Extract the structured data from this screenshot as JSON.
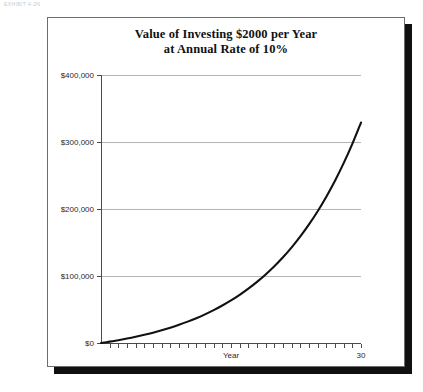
{
  "page_header": "EXHIBIT 4-2N",
  "chart_data": {
    "type": "line",
    "title_lines": [
      "Value of Investing $2000 per Year",
      "at Annual Rate of 10%"
    ],
    "title": "Value of Investing $2000 per Year at Annual Rate of 10%",
    "xlabel": "Year",
    "ylabel": "",
    "xlim": [
      0,
      30
    ],
    "ylim": [
      0,
      400000
    ],
    "grid": true,
    "legend": false,
    "x_tick_labels": [
      "30"
    ],
    "x_tick_label_values": [
      30
    ],
    "x_minor_tick_count": 30,
    "y_tick_labels": [
      "$0",
      "$100,000",
      "$200,000",
      "$300,000",
      "$400,000"
    ],
    "y_tick_values": [
      0,
      100000,
      200000,
      300000,
      400000
    ],
    "series_name": "Future value of $2000/year annuity at 10%",
    "line_color": "#111111",
    "x": [
      0,
      1,
      2,
      3,
      4,
      5,
      6,
      7,
      8,
      9,
      10,
      11,
      12,
      13,
      14,
      15,
      16,
      17,
      18,
      19,
      20,
      21,
      22,
      23,
      24,
      25,
      26,
      27,
      28,
      29,
      30
    ],
    "values": [
      0,
      2000,
      4200,
      6620,
      9282,
      12210,
      15431,
      18974,
      22872,
      27159,
      31875,
      37062,
      42769,
      49045,
      55950,
      63545,
      71899,
      81089,
      91200,
      102327,
      114560,
      128016,
      142820,
      159102,
      177013,
      196714,
      218385,
      242224,
      268446,
      297291,
      329020
    ]
  }
}
